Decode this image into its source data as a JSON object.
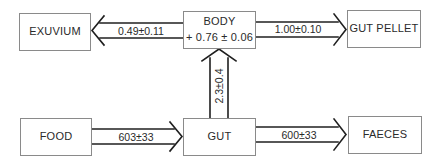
{
  "diagram": {
    "nodes": {
      "exuvium": {
        "label": "EXUVIUM"
      },
      "body": {
        "label": "BODY",
        "sublabel": "+ 0.76 ± 0.06"
      },
      "gut_pellet": {
        "label": "GUT PELLET"
      },
      "food": {
        "label": "FOOD"
      },
      "gut": {
        "label": "GUT"
      },
      "faeces": {
        "label": "FAECES"
      }
    },
    "flows": {
      "body_to_exuvium": {
        "from": "BODY",
        "to": "EXUVIUM",
        "value": "0.49±0.11"
      },
      "body_to_gut_pellet": {
        "from": "BODY",
        "to": "GUT PELLET",
        "value": "1.00±0.10"
      },
      "gut_to_body": {
        "from": "GUT",
        "to": "BODY",
        "value": "2.3±0.4"
      },
      "food_to_gut": {
        "from": "FOOD",
        "to": "GUT",
        "value": "603±33"
      },
      "gut_to_faeces": {
        "from": "GUT",
        "to": "FAECES",
        "value": "600±33"
      }
    },
    "colors": {
      "line": "#1f1f1f",
      "box_border": "#8a8a8a",
      "text": "#2a2a2a",
      "background": "#ffffff"
    }
  }
}
